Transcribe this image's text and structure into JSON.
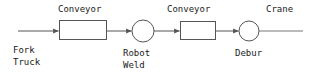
{
  "diagram": {
    "type": "process-flow",
    "canvas": {
      "width": 315,
      "height": 81,
      "background": "#ffffff"
    },
    "stroke_color": "#555555",
    "text_color": "#1a1a1a",
    "labels": {
      "conveyor_1": "Conveyor",
      "conveyor_2": "Conveyor",
      "crane": "Crane",
      "fork_truck_line1": "Fork",
      "fork_truck_line2": "Truck",
      "robot_weld_line1": "Robot",
      "robot_weld_line2": "Weld",
      "debur": "Debur"
    },
    "nodes": [
      {
        "id": "fork-truck",
        "label": "Fork Truck",
        "shape": "arrow-in",
        "x": 18,
        "y": 31
      },
      {
        "id": "conveyor-1",
        "label": "Conveyor",
        "shape": "rectangle",
        "x": 59,
        "y": 20,
        "width": 48,
        "height": 20
      },
      {
        "id": "robot-weld",
        "label": "Robot Weld",
        "shape": "circle",
        "cx": 143,
        "cy": 31,
        "r": 11
      },
      {
        "id": "conveyor-2",
        "label": "Conveyor",
        "shape": "rectangle",
        "x": 180,
        "y": 21,
        "width": 36,
        "height": 19
      },
      {
        "id": "debur",
        "label": "Debur",
        "shape": "circle",
        "cx": 249,
        "cy": 31,
        "r": 10
      },
      {
        "id": "crane",
        "label": "Crane",
        "shape": "line-out",
        "x": 259,
        "y": 31
      }
    ],
    "edges": [
      {
        "from": "fork-truck",
        "to": "conveyor-1",
        "arrow": true
      },
      {
        "from": "conveyor-1",
        "to": "robot-weld",
        "arrow": true
      },
      {
        "from": "robot-weld",
        "to": "conveyor-2",
        "arrow": true
      },
      {
        "from": "conveyor-2",
        "to": "debur",
        "arrow": true
      },
      {
        "from": "debur",
        "to": "crane",
        "arrow": false
      }
    ]
  }
}
